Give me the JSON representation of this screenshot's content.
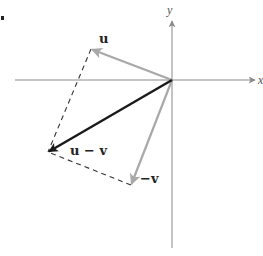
{
  "diagram": {
    "axes": {
      "x_label": "x",
      "y_label": "y",
      "color": "#8a8a8a"
    },
    "vectors": [
      {
        "id": "u",
        "label": "u",
        "color": "#a8a8a8",
        "from": [
          172,
          80
        ],
        "to": [
          91,
          49
        ]
      },
      {
        "id": "neg-v",
        "label": "−v",
        "color": "#a8a8a8",
        "from": [
          172,
          80
        ],
        "to": [
          131,
          185
        ]
      },
      {
        "id": "u-minus-v",
        "label": "u − v",
        "color": "#1a1a1a",
        "from": [
          172,
          80
        ],
        "to": [
          48,
          152
        ]
      }
    ],
    "dashed_edges": [
      {
        "from": [
          91,
          49
        ],
        "to": [
          48,
          152
        ]
      },
      {
        "from": [
          131,
          185
        ],
        "to": [
          48,
          152
        ]
      }
    ],
    "dashed_color": "#333333",
    "marker_dot": "."
  }
}
